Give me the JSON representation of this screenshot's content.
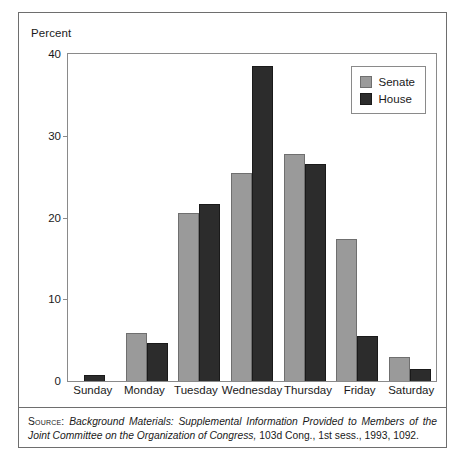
{
  "chart_data": {
    "type": "bar",
    "title": "",
    "xlabel": "",
    "ylabel": "Percent",
    "ylim": [
      0,
      40
    ],
    "yticks": [
      0,
      10,
      20,
      30,
      40
    ],
    "grid": false,
    "legend_position": "top-right",
    "categories": [
      "Sunday",
      "Monday",
      "Tuesday",
      "Wednesday",
      "Thursday",
      "Friday",
      "Saturday"
    ],
    "series": [
      {
        "name": "Senate",
        "color": "#9a9a9a",
        "values": [
          0,
          5.9,
          20.5,
          25.5,
          27.8,
          17.4,
          2.9
        ]
      },
      {
        "name": "House",
        "color": "#2c2c2c",
        "values": [
          0.7,
          4.6,
          21.6,
          38.5,
          26.6,
          5.5,
          1.5
        ]
      }
    ]
  },
  "axis": {
    "y_title": "Percent",
    "y_tick_labels": [
      "40",
      "30",
      "20",
      "10",
      "0"
    ],
    "x_tick_labels": [
      "Sunday",
      "Monday",
      "Tuesday",
      "Wednesday",
      "Thursday",
      "Friday",
      "Saturday"
    ]
  },
  "legend": {
    "entries": [
      {
        "label": "Senate",
        "color": "#9a9a9a"
      },
      {
        "label": "House",
        "color": "#2c2c2c"
      }
    ]
  },
  "source": {
    "label": "Source:",
    "italic_text": "Background Materials: Supplemental Information Provided to Members of the Joint Committee on the Organization of Congress,",
    "tail_text": " 103d Cong., 1st sess., 1993, 1092."
  },
  "colors": {
    "senate": "#9a9a9a",
    "house": "#2c2c2c",
    "frame": "#6e6e6e",
    "axis": "#8a8a8a",
    "text": "#1a1a1a",
    "background": "#ffffff"
  }
}
